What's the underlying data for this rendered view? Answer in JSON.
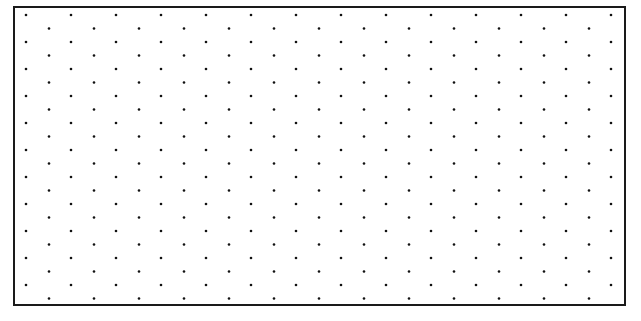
{
  "canvas": {
    "width": 641,
    "height": 321,
    "background": "#ffffff"
  },
  "frame": {
    "left": 13,
    "top": 6,
    "right": 626,
    "bottom": 306,
    "border_color": "#1a1a1a",
    "border_width": 2
  },
  "dot_grid": {
    "pattern": "isometric-staggered",
    "dot_color": "#111111",
    "dot_radius": 1.3,
    "row_start_y": 15,
    "row_step_y": 13.5,
    "row_count": 22,
    "odd_row_start_x": 26,
    "even_row_start_x": 49,
    "col_step_x": 45,
    "odd_row_count": 14,
    "even_row_count": 13
  }
}
